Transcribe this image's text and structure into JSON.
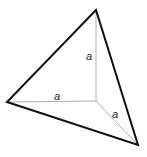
{
  "diagram": {
    "type": "tetrahedron-corner",
    "vertices": {
      "top": [
        96,
        10
      ],
      "left": [
        7,
        102
      ],
      "bottom_right": [
        138,
        145
      ],
      "center": [
        96,
        101
      ]
    },
    "edge_labels": [
      {
        "text": "a",
        "x": 86,
        "y": 60
      },
      {
        "text": "a",
        "x": 54,
        "y": 100
      },
      {
        "text": "a",
        "x": 112,
        "y": 118
      }
    ],
    "colors": {
      "outer_edge": "#111111",
      "inner_edge": "#999999"
    }
  }
}
